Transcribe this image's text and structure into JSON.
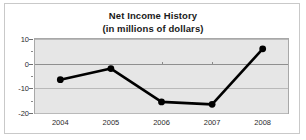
{
  "chart_data": {
    "type": "line",
    "title": "Net Income History",
    "subtitle": "(in millions of dollars)",
    "xlabel": "",
    "ylabel": "",
    "categories": [
      "2004",
      "2005",
      "2006",
      "2007",
      "2008"
    ],
    "values": [
      -6.5,
      -2,
      -15.5,
      -16.5,
      6
    ],
    "series": [
      {
        "name": "Net Income",
        "values": [
          -6.5,
          -2,
          -15.5,
          -16.5,
          6
        ]
      }
    ],
    "ylim": [
      -20,
      10
    ],
    "ytick_labels": [
      "10",
      "0",
      "-10",
      "-20"
    ],
    "ytick_values": [
      10,
      0,
      -10,
      -20
    ],
    "yminor_values": [
      5,
      -5,
      -15
    ],
    "xtick_labels": [
      "2004",
      "2005",
      "2006",
      "2007",
      "2008"
    ],
    "grid": true,
    "legend": "none",
    "line_color": "#000000",
    "marker_color": "#000000",
    "plot_background": "#e6e6e6",
    "gridline_color": "#b9b9b9",
    "zeroline_color": "#8f8f8f"
  }
}
